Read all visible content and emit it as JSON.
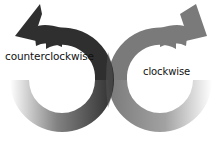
{
  "diagram": {
    "labels": {
      "counterclockwise": "counterclockwise",
      "clockwise": "clockwise"
    },
    "colors": {
      "counterclockwise_arrow": "#2f2f2f",
      "clockwise_arrow": "#7a7a7a",
      "background": "#ffffff"
    },
    "arrows": [
      {
        "name": "counterclockwise-arrow",
        "direction": "counterclockwise",
        "color": "#2f2f2f"
      },
      {
        "name": "clockwise-arrow",
        "direction": "clockwise",
        "color": "#7a7a7a"
      }
    ]
  }
}
